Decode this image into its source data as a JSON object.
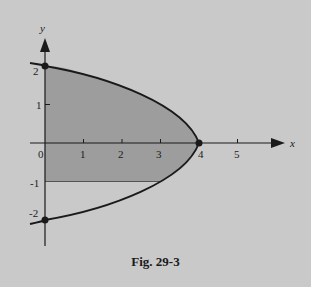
{
  "figure": {
    "caption": "Fig. 29-3",
    "axes": {
      "x_label": "x",
      "y_label": "y",
      "x_ticks": [
        "0",
        "1",
        "2",
        "3",
        "4",
        "5"
      ],
      "y_ticks": [
        "2",
        "1",
        "-1",
        "-2"
      ]
    },
    "curve": "x = 4 - y^2",
    "shaded_region": "0 <= x <= 4 - y^2, -1 <= y <= 2",
    "points": [
      {
        "label": "(0,2)",
        "x": 0,
        "y": 2
      },
      {
        "label": "(4,0)",
        "x": 4,
        "y": 0
      },
      {
        "label": "(0,-2)",
        "x": 0,
        "y": -2
      }
    ],
    "colors": {
      "background": "#c9c9c9",
      "shade": "#9a9a9a",
      "ink": "#1a1a1a"
    }
  }
}
